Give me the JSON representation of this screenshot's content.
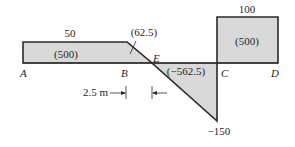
{
  "diagram": {
    "title": "",
    "colors": {
      "fill": "#d9d9d9",
      "stroke": "#2a2a2a",
      "text": "#1f1f1f"
    },
    "points": [
      "A",
      "B",
      "E",
      "C",
      "D"
    ],
    "segments": [
      {
        "id": "AB",
        "value_label": "50",
        "area_label": "(500)"
      },
      {
        "id": "BE",
        "area_label": "(62.5)"
      },
      {
        "id": "EC",
        "area_label": "(-562.5)",
        "end_value_label": "-150"
      },
      {
        "id": "CD",
        "value_label": "100",
        "area_label": "(500)"
      }
    ],
    "dimension": {
      "label": "2.5 m",
      "from": "B",
      "to": "E"
    }
  },
  "labels": {
    "A": "A",
    "B": "B",
    "E": "E",
    "C": "C",
    "D": "D",
    "val_50": "50",
    "val_100": "100",
    "val_neg150": "−150",
    "area_ab": "(500)",
    "area_be": "(62.5)",
    "area_ec": "(−562.5)",
    "area_cd": "(500)",
    "dim": "2.5 m"
  }
}
